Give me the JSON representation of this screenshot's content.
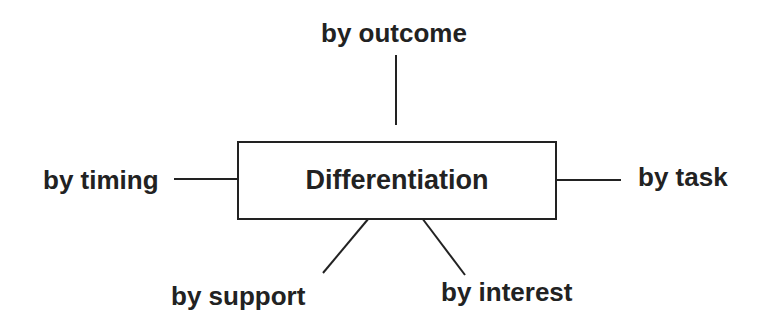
{
  "diagram": {
    "center": {
      "label": "Differentiation"
    },
    "branches": [
      {
        "id": "outcome",
        "label": "by outcome",
        "position": "top"
      },
      {
        "id": "timing",
        "label": "by timing",
        "position": "left"
      },
      {
        "id": "task",
        "label": "by task",
        "position": "right"
      },
      {
        "id": "support",
        "label": "by support",
        "position": "bottom-left"
      },
      {
        "id": "interest",
        "label": "by interest",
        "position": "bottom-right"
      }
    ],
    "colors": {
      "line": "#222222",
      "text": "#222222",
      "background": "#ffffff"
    }
  }
}
